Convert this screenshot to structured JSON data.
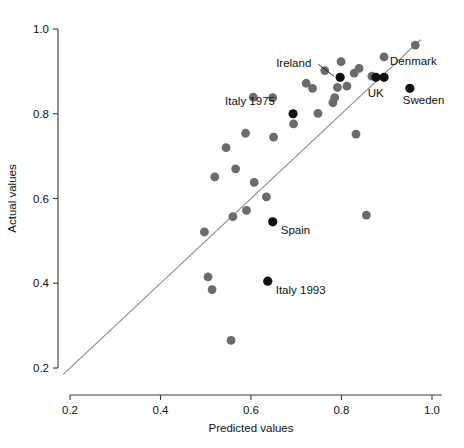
{
  "chart_data": {
    "type": "scatter",
    "title": "",
    "xlabel": "Predicted values",
    "ylabel": "Actual values",
    "xlim": [
      0.17,
      1.02
    ],
    "ylim": [
      0.17,
      1.02
    ],
    "xticks": [
      0.2,
      0.4,
      0.6,
      0.8,
      1.0
    ],
    "yticks": [
      0.2,
      0.4,
      0.6,
      0.8,
      1.0
    ],
    "xticklabels": [
      "0.2",
      "0.4",
      "0.6",
      "0.8",
      "1.0"
    ],
    "yticklabels": [
      "0.2",
      "0.4",
      "0.6",
      "0.8",
      "1.0"
    ],
    "grid": false,
    "legend": "none",
    "reference_line": {
      "description": "y = x identity line",
      "x_start": 0.185,
      "y_start": 0.185,
      "x_end": 0.975,
      "y_end": 0.975,
      "color": "#8a8a8a"
    },
    "marker_colors": {
      "unlabeled": "#6b6b6b",
      "labeled": "#111111"
    },
    "series": [
      {
        "name": "Unlabelled countries",
        "color": "#6b6b6b",
        "points": [
          {
            "x": 0.963,
            "y": 0.962
          },
          {
            "x": 0.894,
            "y": 0.934
          },
          {
            "x": 0.839,
            "y": 0.907
          },
          {
            "x": 0.799,
            "y": 0.923
          },
          {
            "x": 0.763,
            "y": 0.902
          },
          {
            "x": 0.828,
            "y": 0.896
          },
          {
            "x": 0.867,
            "y": 0.889
          },
          {
            "x": 0.722,
            "y": 0.872
          },
          {
            "x": 0.812,
            "y": 0.865
          },
          {
            "x": 0.791,
            "y": 0.862
          },
          {
            "x": 0.736,
            "y": 0.86
          },
          {
            "x": 0.694,
            "y": 0.776
          },
          {
            "x": 0.648,
            "y": 0.838
          },
          {
            "x": 0.605,
            "y": 0.839
          },
          {
            "x": 0.785,
            "y": 0.838
          },
          {
            "x": 0.781,
            "y": 0.826
          },
          {
            "x": 0.748,
            "y": 0.801
          },
          {
            "x": 0.65,
            "y": 0.745
          },
          {
            "x": 0.588,
            "y": 0.754
          },
          {
            "x": 0.545,
            "y": 0.72
          },
          {
            "x": 0.832,
            "y": 0.752
          },
          {
            "x": 0.52,
            "y": 0.651
          },
          {
            "x": 0.566,
            "y": 0.67
          },
          {
            "x": 0.607,
            "y": 0.638
          },
          {
            "x": 0.634,
            "y": 0.604
          },
          {
            "x": 0.59,
            "y": 0.572
          },
          {
            "x": 0.56,
            "y": 0.557
          },
          {
            "x": 0.497,
            "y": 0.521
          },
          {
            "x": 0.855,
            "y": 0.561
          },
          {
            "x": 0.505,
            "y": 0.415
          },
          {
            "x": 0.514,
            "y": 0.385
          },
          {
            "x": 0.556,
            "y": 0.265
          }
        ]
      },
      {
        "name": "Labelled countries",
        "color": "#111111",
        "points": [
          {
            "x": 0.797,
            "y": 0.886,
            "label": "Ireland",
            "label_dx": -64,
            "label_dy": -10,
            "leader": true
          },
          {
            "x": 0.876,
            "y": 0.886,
            "label": "",
            "label_dx": 0,
            "label_dy": 0,
            "leader": false
          },
          {
            "x": 0.894,
            "y": 0.886,
            "label": "Denmark",
            "label_dx": 6,
            "label_dy": -12,
            "leader": false
          },
          {
            "x": 0.951,
            "y": 0.86,
            "label": "Sweden",
            "label_dx": -7,
            "label_dy": 16,
            "leader": false
          },
          {
            "x": 0.693,
            "y": 0.8,
            "label": "Italy 1975",
            "label_dx": -68,
            "label_dy": -9,
            "leader": false
          },
          {
            "x": 0.648,
            "y": 0.545,
            "label": "Spain",
            "label_dx": 8,
            "label_dy": 12,
            "leader": false
          },
          {
            "x": 0.637,
            "y": 0.405,
            "label": "Italy 1993",
            "label_dx": 8,
            "label_dy": 13,
            "leader": false
          }
        ]
      }
    ],
    "extra_labels": [
      {
        "text": "UK",
        "x": 0.858,
        "y": 0.839
      }
    ]
  }
}
